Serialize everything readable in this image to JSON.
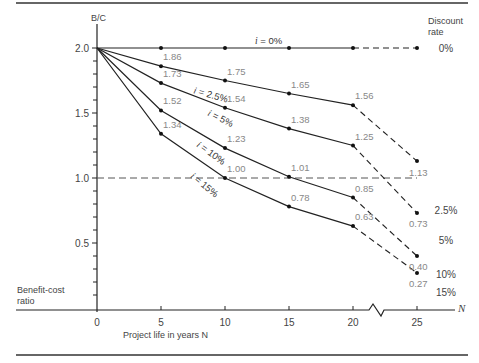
{
  "chart_data": {
    "type": "line",
    "title": "",
    "xlabel": "Project life in years N",
    "ylabel": "Benefit-cost ratio",
    "y_axis_top_label": "B/C",
    "x_axis_end_label": "N",
    "legend_title": "Discount rate",
    "x": [
      0,
      5,
      10,
      15,
      20,
      25
    ],
    "x_ticks": [
      "0",
      "5",
      "10",
      "15",
      "20",
      "25"
    ],
    "y_ticks": [
      "0.5",
      "1.0",
      "1.5",
      "2.0"
    ],
    "ylim": [
      0,
      2.2
    ],
    "xlim": [
      0,
      28
    ],
    "grid": false,
    "axis_break_between": [
      20,
      25
    ],
    "reference_line": {
      "y": 1.0,
      "style": "dashed"
    },
    "legend_position": "right",
    "series": [
      {
        "name": "i = 0%",
        "legend": "0%",
        "values": [
          2.0,
          2.0,
          2.0,
          2.0,
          2.0,
          2.0
        ],
        "labels": [
          "",
          "",
          "",
          "",
          "",
          ""
        ],
        "curve_label": "i = 0%"
      },
      {
        "name": "i = 2.5%",
        "legend": "2.5%",
        "values": [
          2.0,
          1.86,
          1.75,
          1.65,
          1.56,
          1.13
        ],
        "labels": [
          "",
          "1.86",
          "1.75",
          "1.65",
          "1.56",
          "1.13"
        ],
        "curve_label": "i = 2.5%"
      },
      {
        "name": "i = 5%",
        "legend": "5%",
        "values": [
          2.0,
          1.73,
          1.54,
          1.38,
          1.25,
          0.73
        ],
        "labels": [
          "",
          "1.73",
          "1.54",
          "1.38",
          "1.25",
          "0.73"
        ],
        "curve_label": "i = 5%"
      },
      {
        "name": "i = 10%",
        "legend": "10%",
        "values": [
          2.0,
          1.52,
          1.23,
          1.01,
          0.85,
          0.4
        ],
        "labels": [
          "",
          "1.52",
          "1.23",
          "1.01",
          "0.85",
          "0.40"
        ],
        "curve_label": "i = 10%"
      },
      {
        "name": "i = 15%",
        "legend": "15%",
        "values": [
          2.0,
          1.34,
          1.0,
          0.78,
          0.63,
          0.27
        ],
        "labels": [
          "",
          "1.34",
          "1.00",
          "0.78",
          "0.63",
          "0.27"
        ],
        "curve_label": "i = 15%"
      }
    ],
    "note": "Segment from N=20 to N=25 drawn dashed (across axis break)"
  }
}
